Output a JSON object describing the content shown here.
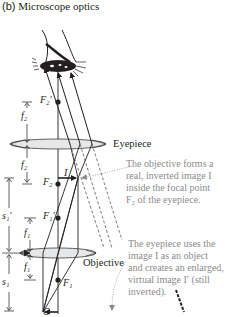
{
  "figure": {
    "panel": "(b)",
    "title": "Microscope optics"
  },
  "labels": {
    "F2_prime": "F₂′",
    "F2": "F₂",
    "F1_prime": "F₁′",
    "F1": "F₁",
    "f2_upper": "f₂",
    "f2_lower": "f₂",
    "f1_upper": "f₁",
    "f1_lower": "f₁",
    "s1_prime": "s₁′",
    "s1": "s₁",
    "image_I": "I",
    "object_O": "O"
  },
  "lenses": {
    "eyepiece": "Eyepiece",
    "objective": "Objective"
  },
  "notes": {
    "objective_note": [
      "The objective forms a",
      "real, inverted image I",
      "inside the focal point",
      "F₂ of the eyepiece."
    ],
    "eyepiece_note": [
      "The eyepiece uses the",
      "image I as an object",
      "and creates an enlarged,",
      "virtual image I′ (still",
      "inverted)."
    ]
  },
  "colors": {
    "ink": "#231f20",
    "lens_fill": "#e6e7e8",
    "note_text": "#8a8a8c",
    "dashed_ray": "#58595b"
  }
}
